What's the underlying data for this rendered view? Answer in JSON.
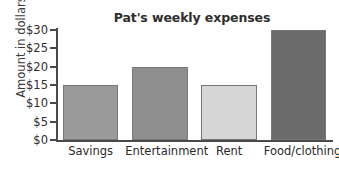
{
  "chart_data": {
    "type": "bar",
    "title": "Pat's weekly expenses",
    "xlabel": "",
    "ylabel": "Amount in dollars",
    "categories": [
      "Savings",
      "Entertainment",
      "Rent",
      "Food/clothing"
    ],
    "values": [
      15,
      20,
      15,
      30
    ],
    "value_prefix": "$",
    "ylim": [
      0,
      30
    ],
    "ytick_values": [
      0,
      5,
      10,
      15,
      20,
      25,
      30
    ],
    "ytick_labels": [
      "$0",
      "$5",
      "$10",
      "$15",
      "$20",
      "$25",
      "$30"
    ],
    "grid": false,
    "legend": false,
    "bar_colors": [
      "#9a9a9a",
      "#8f8f8f",
      "#d6d6d6",
      "#6b6b6b"
    ],
    "bar_border_color": "#777777",
    "axis_color": "#4a4a4a",
    "background_color": "#ffffff",
    "text_color": "#2e2e2e",
    "series": [
      {
        "name": "Weekly expenses",
        "points": [
          {
            "category": "Savings",
            "value": 15,
            "color": "#9a9a9a"
          },
          {
            "category": "Entertainment",
            "value": 20,
            "color": "#8f8f8f"
          },
          {
            "category": "Rent",
            "value": 15,
            "color": "#d6d6d6"
          },
          {
            "category": "Food/clothing",
            "value": 30,
            "color": "#6b6b6b"
          }
        ]
      }
    ]
  }
}
